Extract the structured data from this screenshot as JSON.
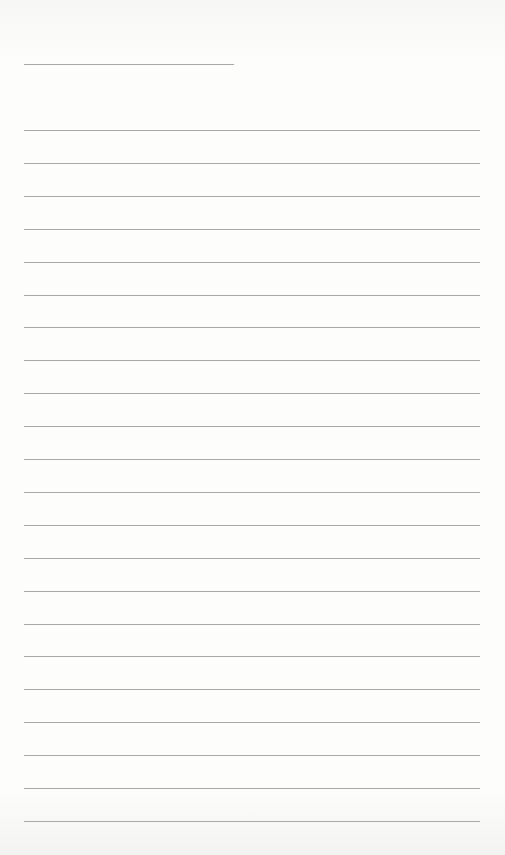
{
  "page": {
    "type": "lined-paper",
    "name_line": {
      "top": 64,
      "left": 24,
      "width": 210
    },
    "rules": {
      "count": 22,
      "first_top": 130,
      "spacing": 32.9,
      "left": 24,
      "width": 456
    },
    "line_color": "#a8a8a8",
    "background_color": "#fdfdfc"
  }
}
